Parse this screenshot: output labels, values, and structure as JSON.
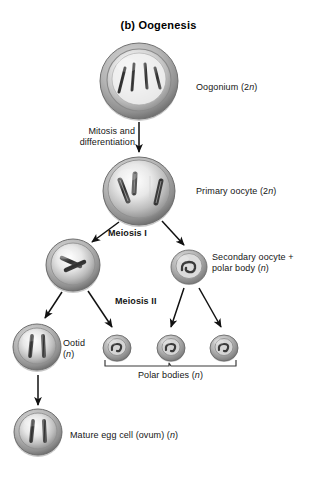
{
  "figure": {
    "title": "(b) Oogenesis",
    "background_color": "#ffffff",
    "text_color": "#151515"
  },
  "labels": {
    "oogonium": "Oogonium (2",
    "oogonium_italic": "n",
    "oogonium_tail": ")",
    "mitosis_bold": "Mitosis",
    "mitosis_rest": " and\ndifferentiation",
    "primary_oocyte": "Primary oocyte (2",
    "primary_oocyte_italic": "n",
    "primary_oocyte_tail": ")",
    "meiosis_1": "Meiosis I",
    "secondary_oocyte": "Secondary oocyte +\npolar body (",
    "secondary_oocyte_italic": "n",
    "secondary_oocyte_tail": ")",
    "meiosis_2": "Meiosis II",
    "ootid": "Ootid\n(",
    "ootid_italic": "n",
    "ootid_tail": ")",
    "polar_bodies": "Polar bodies (",
    "polar_bodies_italic": "n",
    "polar_bodies_tail": ")",
    "mature_egg": "Mature egg cell (ovum) (",
    "mature_egg_italic": "n",
    "mature_egg_tail": ")"
  },
  "cells": [
    {
      "name": "oogonium",
      "stage": "Oogonium",
      "ploidy": "2n",
      "cx": 139,
      "cy": 81,
      "r": 39,
      "chromosomes": 4,
      "chromosome_style": "thin",
      "size": "large"
    },
    {
      "name": "primary-oocyte",
      "stage": "Primary oocyte",
      "ploidy": "2n",
      "cx": 139,
      "cy": 191,
      "r": 36,
      "chromosomes": 4,
      "chromosome_style": "duplicated",
      "size": "large"
    },
    {
      "name": "secondary-oocyte",
      "stage": "Secondary oocyte",
      "ploidy": "n",
      "cx": 73,
      "cy": 265,
      "r": 27,
      "chromosomes": 2,
      "chromosome_style": "duplicated",
      "size": "medium"
    },
    {
      "name": "first-polar-body",
      "stage": "Polar body",
      "ploidy": "n",
      "cx": 189,
      "cy": 267,
      "r": 18,
      "chromosomes": 2,
      "chromosome_style": "coiled",
      "size": "small"
    },
    {
      "name": "ootid",
      "stage": "Ootid",
      "ploidy": "n",
      "cx": 37,
      "cy": 347,
      "r": 24,
      "chromosomes": 2,
      "chromosome_style": "thin",
      "size": "medium"
    },
    {
      "name": "polar-body-1",
      "stage": "Polar body",
      "ploidy": "n",
      "cx": 117,
      "cy": 348,
      "r": 14,
      "chromosomes": 1,
      "chromosome_style": "coiled",
      "size": "tiny"
    },
    {
      "name": "polar-body-2",
      "stage": "Polar body",
      "ploidy": "n",
      "cx": 171,
      "cy": 348,
      "r": 14,
      "chromosomes": 1,
      "chromosome_style": "coiled",
      "size": "tiny"
    },
    {
      "name": "polar-body-3",
      "stage": "Polar body",
      "ploidy": "n",
      "cx": 224,
      "cy": 348,
      "r": 14,
      "chromosomes": 1,
      "chromosome_style": "coiled",
      "size": "tiny"
    },
    {
      "name": "mature-egg-cell",
      "stage": "Mature egg cell (ovum)",
      "ploidy": "n",
      "cx": 38,
      "cy": 432,
      "r": 24,
      "chromosomes": 2,
      "chromosome_style": "thin",
      "size": "medium"
    }
  ],
  "arrows": [
    {
      "name": "oogonium-to-primary-oocyte",
      "x1": 139,
      "y1": 122,
      "x2": 139,
      "y2": 152
    },
    {
      "name": "primary-to-secondary-oocyte",
      "x1": 118,
      "y1": 222,
      "x2": 90,
      "y2": 243
    },
    {
      "name": "primary-to-first-polar-body",
      "x1": 163,
      "y1": 221,
      "x2": 185,
      "y2": 246
    },
    {
      "name": "secondary-to-ootid",
      "x1": 63,
      "y1": 292,
      "x2": 45,
      "y2": 319
    },
    {
      "name": "secondary-to-polar-body-1",
      "x1": 88,
      "y1": 292,
      "x2": 112,
      "y2": 327
    },
    {
      "name": "first-polar-to-polar-body-2",
      "x1": 184,
      "y1": 288,
      "x2": 170,
      "y2": 327
    },
    {
      "name": "first-polar-to-polar-body-3",
      "x1": 199,
      "y1": 288,
      "x2": 221,
      "y2": 327
    },
    {
      "name": "ootid-to-mature-egg",
      "x1": 38,
      "y1": 375,
      "x2": 38,
      "y2": 406
    }
  ],
  "bracket": {
    "name": "polar-bodies-bracket",
    "x_start": 105,
    "x_end": 236,
    "y": 366
  }
}
